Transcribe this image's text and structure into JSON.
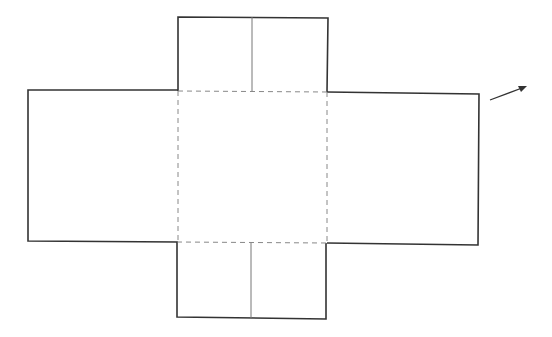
{
  "diagram": {
    "type": "box-net",
    "colors": {
      "background": "#ffffff",
      "outline": "#333333",
      "fold_line": "#888888",
      "divider": "#666666",
      "arrow": "#333333"
    },
    "panels": [
      {
        "name": "center",
        "x1": 178,
        "y1": 91,
        "x2": 327,
        "y2": 242
      },
      {
        "name": "top-flap",
        "x1": 178,
        "y1": 17,
        "x2": 327,
        "y2": 91
      },
      {
        "name": "bottom-flap",
        "x1": 177,
        "y1": 242,
        "x2": 326,
        "y2": 318
      },
      {
        "name": "left-flap",
        "x1": 28,
        "y1": 90,
        "x2": 178,
        "y2": 241
      },
      {
        "name": "right-flap",
        "x1": 327,
        "y1": 93,
        "x2": 479,
        "y2": 245
      }
    ],
    "arrow": {
      "x1": 490,
      "y1": 100,
      "x2": 526,
      "y2": 87
    }
  }
}
